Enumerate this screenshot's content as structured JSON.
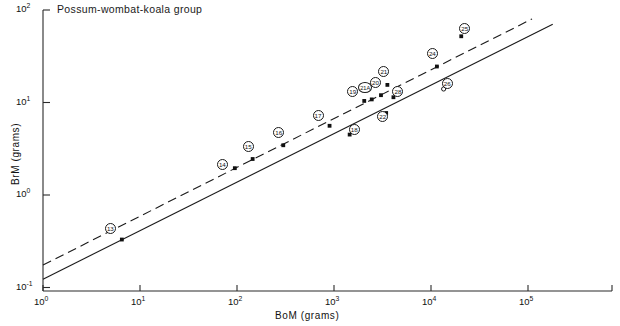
{
  "chart_data": {
    "type": "scatter",
    "title": "Possum-wombat-koala  group",
    "xlabel": "BoM  (grams)",
    "ylabel": "BrM  (grams)",
    "xscale": "log",
    "yscale": "log",
    "xlim": [
      1,
      1000000
    ],
    "ylim": [
      0.1,
      100
    ],
    "grid": false,
    "legend": null,
    "xticks": [
      {
        "value": 1,
        "label": "10",
        "exp": "0"
      },
      {
        "value": 10,
        "label": "10",
        "exp": "1"
      },
      {
        "value": 100,
        "label": "10",
        "exp": "2"
      },
      {
        "value": 1000,
        "label": "10",
        "exp": "3"
      },
      {
        "value": 10000,
        "label": "10",
        "exp": "4"
      },
      {
        "value": 100000,
        "label": "10",
        "exp": "5"
      }
    ],
    "yticks": [
      {
        "value": 100,
        "label": "10",
        "exp": "2"
      },
      {
        "value": 10,
        "label": "10",
        "exp": "1"
      },
      {
        "value": 1,
        "label": "10",
        "exp": "0"
      },
      {
        "value": 0.1,
        "label": "10",
        "exp": "-1"
      }
    ],
    "points": [
      {
        "id": "13",
        "x": 6.5,
        "y": 0.33,
        "marker": "filled-square",
        "label_dx": -12,
        "label_dy": -11
      },
      {
        "id": "14",
        "x": 95,
        "y": 1.95,
        "marker": "filled-square",
        "label_dx": -13,
        "label_dy": -4
      },
      {
        "id": "15",
        "x": 145,
        "y": 2.45,
        "marker": "filled-square",
        "label_dx": -5,
        "label_dy": -13
      },
      {
        "id": "16",
        "x": 300,
        "y": 3.45,
        "marker": "filled-square",
        "label_dx": -5,
        "label_dy": -13
      },
      {
        "id": "17",
        "x": 900,
        "y": 5.6,
        "marker": "filled-square",
        "label_dx": -12,
        "label_dy": -10
      },
      {
        "id": "18",
        "x": 1450,
        "y": 4.5,
        "marker": "filled-square",
        "label_dx": 4,
        "label_dy": -5
      },
      {
        "id": "19",
        "x": 2050,
        "y": 10.4,
        "marker": "filled-square",
        "label_dx": -12,
        "label_dy": -9
      },
      {
        "id": "21A",
        "x": 2450,
        "y": 10.8,
        "marker": "filled-square",
        "label_dx": -7,
        "label_dy": -12
      },
      {
        "id": "20",
        "x": 3050,
        "y": 12.0,
        "marker": "filled-square",
        "label_dx": -6,
        "label_dy": -13
      },
      {
        "id": "21",
        "x": 3550,
        "y": 15.5,
        "marker": "filled-square",
        "label_dx": -4,
        "label_dy": -13
      },
      {
        "id": "28",
        "x": 4100,
        "y": 11.4,
        "marker": "filled-square",
        "label_dx": 4,
        "label_dy": -6
      },
      {
        "id": "22",
        "x": 3450,
        "y": 7.7,
        "marker": "filled-square",
        "label_dx": -4,
        "label_dy": 4
      },
      {
        "id": "24",
        "x": 11500,
        "y": 24.5,
        "marker": "filled-square",
        "label_dx": -5,
        "label_dy": -13
      },
      {
        "id": "25",
        "x": 20500,
        "y": 52.0,
        "marker": "filled-square",
        "label_dx": 3,
        "label_dy": -8
      },
      {
        "id": "26",
        "x": 13500,
        "y": 14.0,
        "marker": "open-circle",
        "label_dx": 3,
        "label_dy": -5
      }
    ],
    "lines": [
      {
        "name": "regression-line",
        "style": "solid",
        "x0": 1,
        "y0": 0.123,
        "x1": 180000,
        "y1": 70.0
      },
      {
        "name": "reference-line",
        "style": "dashed",
        "x0": 1,
        "y0": 0.175,
        "x1": 110000,
        "y1": 80.0
      }
    ]
  }
}
